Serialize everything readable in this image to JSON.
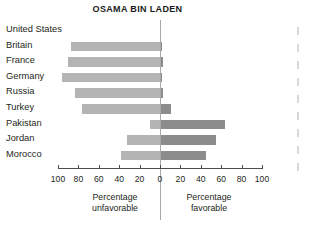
{
  "chart_data": {
    "type": "bar",
    "title": "OSAMA BIN LADEN",
    "subtitle": "",
    "orientation": "horizontal-diverging",
    "xlabel": "",
    "ylabel": "",
    "xlim": [
      -100,
      100
    ],
    "grid": false,
    "legend_position": "none",
    "axis_ticks": [
      {
        "value": -100,
        "label": "100"
      },
      {
        "value": -80,
        "label": "80"
      },
      {
        "value": -60,
        "label": "60"
      },
      {
        "value": -40,
        "label": "40"
      },
      {
        "value": -20,
        "label": "20"
      },
      {
        "value": 0,
        "label": "0"
      },
      {
        "value": 20,
        "label": "20"
      },
      {
        "value": 40,
        "label": "40"
      },
      {
        "value": 60,
        "label": "60"
      },
      {
        "value": 80,
        "label": "80"
      },
      {
        "value": 100,
        "label": "100"
      }
    ],
    "categories": [
      "United States",
      "Britain",
      "France",
      "Germany",
      "Russia",
      "Turkey",
      "Pakistan",
      "Jordan",
      "Morocco"
    ],
    "series": [
      {
        "name": "Percentage unfavorable",
        "color": "#b4b4b4",
        "values": [
          null,
          87,
          90,
          96,
          83,
          76,
          10,
          32,
          38
        ]
      },
      {
        "name": "Percentage favorable",
        "color": "#8c8c8c",
        "values": [
          null,
          2,
          3,
          2,
          3,
          11,
          64,
          55,
          45
        ]
      }
    ],
    "captions": {
      "left": {
        "line1": "Percentage",
        "line2": "unfavorable"
      },
      "right": {
        "line1": "Percentage",
        "line2": "favorable"
      }
    }
  }
}
